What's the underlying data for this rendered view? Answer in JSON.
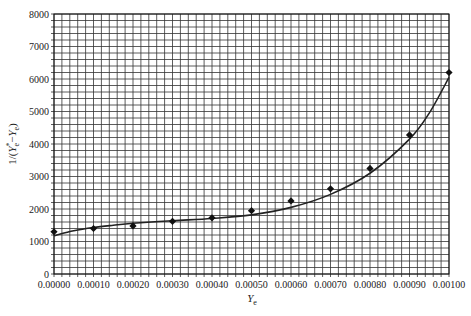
{
  "chart_data": {
    "type": "scatter",
    "title": "",
    "xlabel": "Y_e",
    "xlabel_main": "Y",
    "xlabel_sub": "e",
    "ylabel": "1/(Y*_e − Y_e)",
    "ylabel_parts": {
      "prefix": "1/(",
      "y1": "Y",
      "y1_sup": "*",
      "y1_sub": "e",
      "minus": "−",
      "y2": "Y",
      "y2_sub": "e",
      "suffix": ")"
    },
    "xlim": [
      0,
      0.001
    ],
    "ylim": [
      0,
      8000
    ],
    "grid": true,
    "minor_grid": {
      "x_step": 2e-05,
      "y_step": 200
    },
    "x_ticks": [
      0,
      0.0001,
      0.0002,
      0.0003,
      0.0004,
      0.0005,
      0.0006,
      0.0007,
      0.0008,
      0.0009,
      0.001
    ],
    "x_tick_labels": [
      "0.00000",
      "0.00010",
      "0.00020",
      "0.00030",
      "0.00040",
      "0.00050",
      "0.00060",
      "0.00070",
      "0.00080",
      "0.00090",
      "0.00100"
    ],
    "y_ticks": [
      0,
      1000,
      2000,
      3000,
      4000,
      5000,
      6000,
      7000,
      8000
    ],
    "y_tick_labels": [
      "0",
      "1000",
      "2000",
      "3000",
      "4000",
      "5000",
      "6000",
      "7000",
      "8000"
    ],
    "legend": null,
    "series": [
      {
        "name": "data points",
        "marker": "diamond",
        "x": [
          0,
          0.0001,
          0.0002,
          0.0003,
          0.0004,
          0.0005,
          0.0006,
          0.0007,
          0.0008,
          0.0009,
          0.001
        ],
        "y": [
          1300,
          1400,
          1480,
          1620,
          1730,
          1950,
          2250,
          2620,
          3250,
          4280,
          6200
        ]
      },
      {
        "name": "fitted curve",
        "type": "line",
        "x": [
          0,
          5e-05,
          0.0001,
          0.00015,
          0.0002,
          0.0003,
          0.0004,
          0.0005,
          0.0006,
          0.0007,
          0.0008,
          0.0009,
          0.00095,
          0.001
        ],
        "y": [
          1180,
          1330,
          1430,
          1500,
          1560,
          1640,
          1710,
          1820,
          2050,
          2450,
          3100,
          4150,
          4950,
          6050
        ]
      }
    ]
  }
}
